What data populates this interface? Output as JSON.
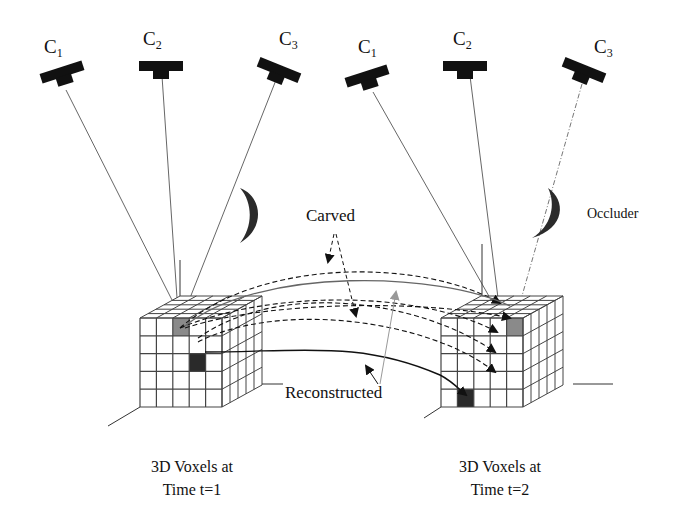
{
  "figure": {
    "type": "multi-view voxel carving over time diagram",
    "colors": {
      "ink": "#111111",
      "ray": "#555555",
      "grid": "#444444",
      "voxel_gray": "#8a8a8a",
      "voxel_dark": "#2a2a2a",
      "occluder": "#2b2b2b",
      "reconstructed_arrow": "#999999"
    }
  },
  "cameras": {
    "time1": [
      {
        "id": "C1",
        "base": "C",
        "sub": "1"
      },
      {
        "id": "C2",
        "base": "C",
        "sub": "2"
      },
      {
        "id": "C3",
        "base": "C",
        "sub": "3"
      }
    ],
    "time2": [
      {
        "id": "C1",
        "base": "C",
        "sub": "1"
      },
      {
        "id": "C2",
        "base": "C",
        "sub": "2"
      },
      {
        "id": "C3",
        "base": "C",
        "sub": "3",
        "ray_style": "dash-dot (occluded)"
      }
    ]
  },
  "labels": {
    "carved": "Carved",
    "reconstructed": "Reconstructed",
    "occluder": "Occluder"
  },
  "captions": {
    "left_line1": "3D Voxels at",
    "left_line2": "Time t=1",
    "right_line1": "3D Voxels at",
    "right_line2": "Time t=2"
  },
  "voxel_grids": {
    "resolution": "5x5x5",
    "left": {
      "time": "t=1",
      "highlighted": [
        "gray voxel row1 col2",
        "dark voxel row3 col3"
      ]
    },
    "right": {
      "time": "t=2",
      "highlighted": [
        "gray voxel row1 col5",
        "dark voxel row5 col2"
      ]
    }
  }
}
